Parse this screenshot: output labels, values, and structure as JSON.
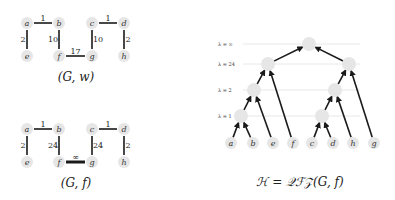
{
  "graph_w": {
    "caption": "(G, w)",
    "nodes": [
      {
        "id": "a",
        "label": "a",
        "x": 27,
        "y": 23
      },
      {
        "id": "b",
        "label": "b",
        "x": 59,
        "y": 23
      },
      {
        "id": "c",
        "label": "c",
        "x": 92,
        "y": 23
      },
      {
        "id": "d",
        "label": "d",
        "x": 124,
        "y": 23
      },
      {
        "id": "e",
        "label": "e",
        "x": 27,
        "y": 56
      },
      {
        "id": "f",
        "label": "f",
        "x": 59,
        "y": 56
      },
      {
        "id": "g",
        "label": "g",
        "x": 92,
        "y": 56
      },
      {
        "id": "h",
        "label": "h",
        "x": 124,
        "y": 56
      }
    ],
    "edges": [
      {
        "from": "a",
        "to": "b",
        "weight": "1"
      },
      {
        "from": "c",
        "to": "d",
        "weight": "1"
      },
      {
        "from": "a",
        "to": "e",
        "weight": "2"
      },
      {
        "from": "b",
        "to": "f",
        "weight": "10"
      },
      {
        "from": "c",
        "to": "g",
        "weight": "10"
      },
      {
        "from": "d",
        "to": "h",
        "weight": "2"
      },
      {
        "from": "f",
        "to": "g",
        "weight": "17"
      }
    ]
  },
  "graph_f": {
    "caption": "(G, f)",
    "nodes": [
      {
        "id": "a",
        "label": "a",
        "x": 27,
        "y": 129
      },
      {
        "id": "b",
        "label": "b",
        "x": 59,
        "y": 129
      },
      {
        "id": "c",
        "label": "c",
        "x": 92,
        "y": 129
      },
      {
        "id": "d",
        "label": "d",
        "x": 124,
        "y": 129
      },
      {
        "id": "e",
        "label": "e",
        "x": 27,
        "y": 162
      },
      {
        "id": "f",
        "label": "f",
        "x": 59,
        "y": 162
      },
      {
        "id": "g",
        "label": "g",
        "x": 92,
        "y": 162
      },
      {
        "id": "h",
        "label": "h",
        "x": 124,
        "y": 162
      }
    ],
    "edges": [
      {
        "from": "a",
        "to": "b",
        "weight": "1"
      },
      {
        "from": "c",
        "to": "d",
        "weight": "1"
      },
      {
        "from": "a",
        "to": "e",
        "weight": "2"
      },
      {
        "from": "b",
        "to": "f",
        "weight": "24"
      },
      {
        "from": "c",
        "to": "g",
        "weight": "24"
      },
      {
        "from": "d",
        "to": "h",
        "weight": "2"
      },
      {
        "from": "f",
        "to": "g",
        "weight": "∞",
        "heavy": true
      }
    ]
  },
  "hierarchy": {
    "caption": "ℋ = 𝒬ℱ𝒵(G, f)",
    "levels": [
      {
        "label": "λ = ∞",
        "y": 44
      },
      {
        "label": "λ = 24",
        "y": 64
      },
      {
        "label": "λ = 2",
        "y": 90
      },
      {
        "label": "λ = 1",
        "y": 116
      }
    ],
    "internal_nodes": [
      {
        "id": "root",
        "x": 309,
        "y": 44
      },
      {
        "id": "L24",
        "x": 268,
        "y": 64
      },
      {
        "id": "R24",
        "x": 349,
        "y": 64
      },
      {
        "id": "L2",
        "x": 254,
        "y": 90
      },
      {
        "id": "R2",
        "x": 335,
        "y": 90
      },
      {
        "id": "L1",
        "x": 241,
        "y": 116
      },
      {
        "id": "R1",
        "x": 322,
        "y": 116
      }
    ],
    "leaves": [
      {
        "id": "a",
        "label": "a",
        "x": 231,
        "y": 143
      },
      {
        "id": "b",
        "label": "b",
        "x": 253,
        "y": 143
      },
      {
        "id": "e",
        "label": "e",
        "x": 273,
        "y": 143
      },
      {
        "id": "f",
        "label": "f",
        "x": 293,
        "y": 143
      },
      {
        "id": "c",
        "label": "c",
        "x": 312,
        "y": 143
      },
      {
        "id": "d",
        "label": "d",
        "x": 333,
        "y": 143
      },
      {
        "id": "h",
        "label": "h",
        "x": 353,
        "y": 143
      },
      {
        "id": "g",
        "label": "g",
        "x": 374,
        "y": 143
      }
    ],
    "edges": [
      {
        "child": "L24",
        "parent": "root"
      },
      {
        "child": "R24",
        "parent": "root"
      },
      {
        "child": "L2",
        "parent": "L24"
      },
      {
        "child": "f",
        "parent": "L24"
      },
      {
        "child": "R2",
        "parent": "R24"
      },
      {
        "child": "g",
        "parent": "R24"
      },
      {
        "child": "L1",
        "parent": "L2"
      },
      {
        "child": "e",
        "parent": "L2"
      },
      {
        "child": "R1",
        "parent": "R2"
      },
      {
        "child": "h",
        "parent": "R2"
      },
      {
        "child": "a",
        "parent": "L1"
      },
      {
        "child": "b",
        "parent": "L1"
      },
      {
        "child": "c",
        "parent": "R1"
      },
      {
        "child": "d",
        "parent": "R1"
      }
    ]
  }
}
